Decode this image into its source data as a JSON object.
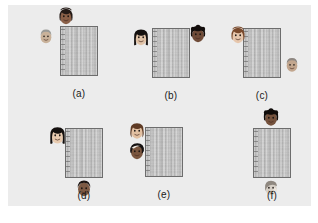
{
  "figure": {
    "background_color": "#ffffff",
    "plate_color": "#ececec",
    "patch_border_color": "#6d6d6d",
    "patch_fill_color": "#c2c2c2"
  },
  "panels": [
    {
      "id": "panel-a",
      "caption": "(a)",
      "patch": {
        "x": 60,
        "y": 26,
        "w": 38,
        "h": 50
      },
      "faces": [
        {
          "name": "face-dark-bob",
          "x": 56,
          "y": 6,
          "w": 20,
          "h": 20,
          "skin": "#8a6048",
          "hair": "#241a16",
          "style": "bob"
        },
        {
          "name": "face-light-short",
          "x": 37,
          "y": 26,
          "w": 18,
          "h": 20,
          "skin": "#c9b29a",
          "hair": "#9a9a96",
          "style": "short"
        }
      ]
    },
    {
      "id": "panel-b",
      "caption": "(b)",
      "patch": {
        "x": 152,
        "y": 28,
        "w": 38,
        "h": 50
      },
      "faces": [
        {
          "name": "face-long-black-hair",
          "x": 131,
          "y": 26,
          "w": 20,
          "h": 22,
          "skin": "#e0c3a8",
          "hair": "#15110f",
          "style": "long"
        },
        {
          "name": "face-dark-curly",
          "x": 187,
          "y": 24,
          "w": 22,
          "h": 20,
          "skin": "#6f4b38",
          "hair": "#120d0b",
          "style": "curly"
        }
      ]
    },
    {
      "id": "panel-c",
      "caption": "(c)",
      "patch": {
        "x": 243,
        "y": 28,
        "w": 38,
        "h": 50
      },
      "faces": [
        {
          "name": "face-auburn-bob",
          "x": 228,
          "y": 25,
          "w": 20,
          "h": 20,
          "skin": "#e6c6ac",
          "hair": "#7a4a2c",
          "style": "bob"
        },
        {
          "name": "face-grey-short",
          "x": 283,
          "y": 55,
          "w": 18,
          "h": 19,
          "skin": "#c2a68e",
          "hair": "#8e8781",
          "style": "short"
        }
      ]
    },
    {
      "id": "panel-d",
      "caption": "(d)",
      "patch": {
        "x": 65,
        "y": 128,
        "w": 38,
        "h": 50
      },
      "faces": [
        {
          "name": "face-black-long-hair",
          "x": 47,
          "y": 124,
          "w": 21,
          "h": 22,
          "skin": "#e8cbb0",
          "hair": "#14100e",
          "style": "long"
        },
        {
          "name": "face-dark-round",
          "x": 74,
          "y": 178,
          "w": 20,
          "h": 20,
          "skin": "#7d5a44",
          "hair": "#1d1512",
          "style": "round"
        }
      ]
    },
    {
      "id": "panel-e",
      "caption": "(e)",
      "patch": {
        "x": 145,
        "y": 127,
        "w": 38,
        "h": 50
      },
      "faces": [
        {
          "name": "face-brown-wavy",
          "x": 127,
          "y": 120,
          "w": 20,
          "h": 21,
          "skin": "#e2c0a2",
          "hair": "#5e3a24",
          "style": "wavy"
        },
        {
          "name": "face-dark-side",
          "x": 127,
          "y": 141,
          "w": 20,
          "h": 20,
          "skin": "#7a563f",
          "hair": "#141010",
          "style": "side"
        }
      ]
    },
    {
      "id": "panel-f",
      "caption": "(f)",
      "patch": {
        "x": 253,
        "y": 128,
        "w": 38,
        "h": 50
      },
      "faces": [
        {
          "name": "face-dark-top",
          "x": 261,
          "y": 107,
          "w": 20,
          "h": 21,
          "skin": "#75523d",
          "hair": "#100c0a",
          "style": "curly"
        },
        {
          "name": "face-grey-profile",
          "x": 261,
          "y": 178,
          "w": 20,
          "h": 19,
          "skin": "#d6cfc6",
          "hair": "#8f8880",
          "style": "profile"
        }
      ]
    }
  ],
  "captions": {
    "a": "(a)",
    "b": "(b)",
    "c": "(c)",
    "d": "(d)",
    "e": "(e)",
    "f": "(f)"
  }
}
